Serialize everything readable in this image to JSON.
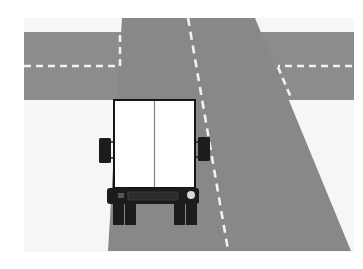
{
  "scene": {
    "description": "Rear view of a box truck on a road approaching an intersection",
    "colors": {
      "background": "#ffffff",
      "ground": "#f6f6f6",
      "road": "#8c8c8c",
      "road_dark": "#858585",
      "lane_marking": "#f2f2f2",
      "truck_body": "#ffffff",
      "truck_outline": "#151515",
      "truck_divider": "#8a8a8a",
      "truck_parts": "#1c1c1c",
      "light": "#d8d8d8"
    },
    "elements": {
      "cross_road": "horizontal-road",
      "main_road": "main-road",
      "truck": "box-truck"
    }
  }
}
